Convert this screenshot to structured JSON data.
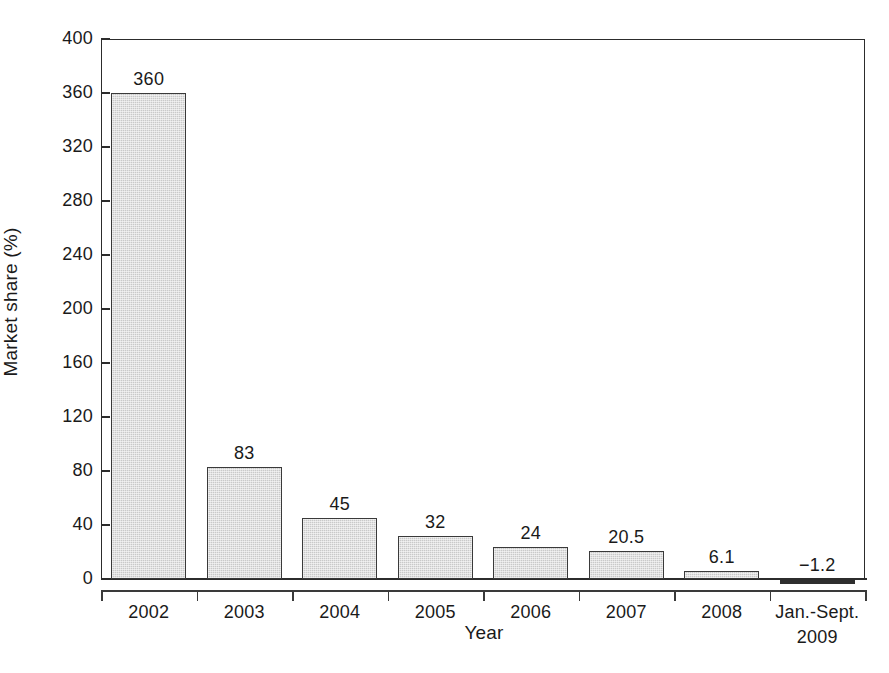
{
  "chart_data": {
    "type": "bar",
    "title": "",
    "xlabel": "Year",
    "ylabel": "Market share (%)",
    "categories": [
      "2002",
      "2003",
      "2004",
      "2005",
      "2006",
      "2007",
      "2008",
      "Jan.-Sept. 2009"
    ],
    "category_lines": [
      [
        "2002"
      ],
      [
        "2003"
      ],
      [
        "2004"
      ],
      [
        "2005"
      ],
      [
        "2006"
      ],
      [
        "2007"
      ],
      [
        "2008"
      ],
      [
        "Jan.-Sept.",
        "2009"
      ]
    ],
    "values": [
      360,
      83,
      45,
      32,
      24,
      20.5,
      6.1,
      -1.2
    ],
    "data_labels": [
      "360",
      "83",
      "45",
      "32",
      "24",
      "20.5",
      "6.1",
      "−1.2"
    ],
    "ylim": [
      0,
      400
    ],
    "yticks": [
      0,
      40,
      80,
      120,
      160,
      200,
      240,
      280,
      320,
      360,
      400
    ],
    "ytick_labels": [
      "0",
      "40",
      "80",
      "120",
      "160",
      "200",
      "240",
      "280",
      "320",
      "360",
      "400"
    ],
    "grid": false,
    "legend": null,
    "bar_fill_color": "#c9c9c9",
    "bar_edge_color": "#3a3a3a",
    "negative_bar_color": "#2e2e2e",
    "axis_color": "#2c2c2c",
    "background_color": "#ffffff"
  }
}
